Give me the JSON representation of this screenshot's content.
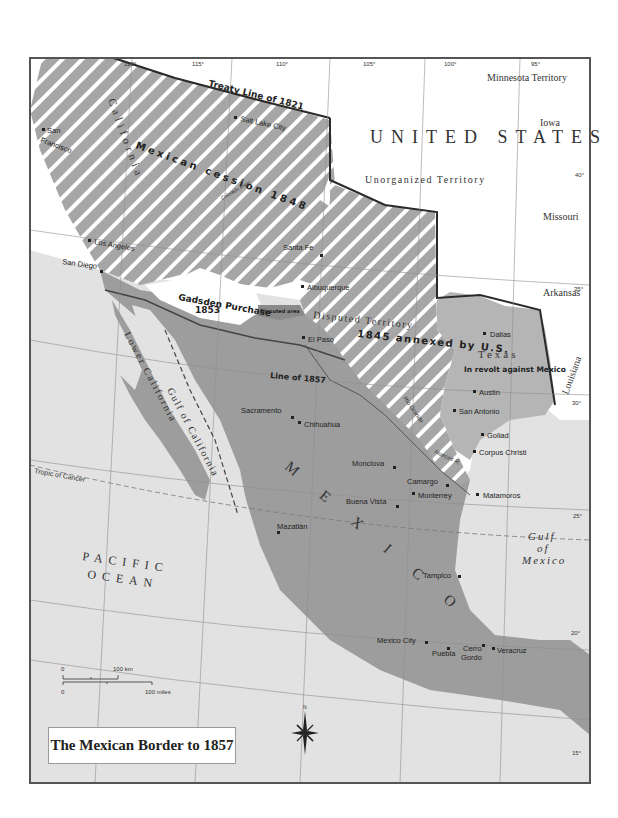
{
  "map": {
    "title": "The Mexican Border to 1857",
    "colors": {
      "mexico": "#9d9d9d",
      "us_land": "#ffffff",
      "water": "#e2e2e2",
      "hatch_base": "#a6a6a6",
      "hatch_stripe": "#ffffff",
      "texas": "#b5b5b5",
      "gadsden": "#ffffff",
      "border_dark": "#2a2a2a",
      "frame": "#555555"
    },
    "regions": {
      "united_states": "UNITED STATES",
      "unorganized": "Unorganized Territory",
      "minnesota": "Minnesota Territory",
      "iowa": "Iowa",
      "missouri": "Missouri",
      "arkansas": "Arkansas",
      "louisiana": "Louisiana",
      "california": "California",
      "mexican_cession": "Mexican cession 1848",
      "gadsden": "Gadsden Purchase",
      "gadsden_year": "1853",
      "disputed_area": "Disputed area",
      "disputed_territory": "Disputed Territory",
      "annexed": "1845 annexed by U.S.",
      "texas": "Texas",
      "texas_revolt": "In revolt against Mexico",
      "mexico": "M E X I C O",
      "lower_california": "Lower California",
      "gulf_california": "Gulf of California",
      "pacific_1": "PACIFIC",
      "pacific_2": "OCEAN",
      "gulf_mexico_1": "Gulf",
      "gulf_mexico_2": "of",
      "gulf_mexico_3": "Mexico"
    },
    "lines": {
      "treaty_1821": "Treaty Line of 1821",
      "line_1857": "Line of 1857",
      "tropic": "Tropic of Cancer",
      "rio_grande": "Rio Grande",
      "nueces": "Nueces R.",
      "colorado": "Colorado River"
    },
    "longitudes": [
      "120°",
      "115°",
      "110°",
      "105°",
      "100°",
      "95°"
    ],
    "latitudes": [
      "40°",
      "35°",
      "30°",
      "25°",
      "20°",
      "15°"
    ],
    "cities": [
      {
        "name": "San Francisco",
        "line1": "San",
        "line2": "Francisco"
      },
      {
        "name": "Salt Lake City"
      },
      {
        "name": "Los Angeles"
      },
      {
        "name": "San Diego"
      },
      {
        "name": "Santa Fe"
      },
      {
        "name": "Albuquerque"
      },
      {
        "name": "El Paso"
      },
      {
        "name": "Dallas"
      },
      {
        "name": "Austin"
      },
      {
        "name": "San Antonio"
      },
      {
        "name": "Goliad"
      },
      {
        "name": "Corpus Christi"
      },
      {
        "name": "Sacramento"
      },
      {
        "name": "Chihuahua"
      },
      {
        "name": "Monclova"
      },
      {
        "name": "Camargo"
      },
      {
        "name": "Monterrey"
      },
      {
        "name": "Buena Vista"
      },
      {
        "name": "Matamoros"
      },
      {
        "name": "Mazatlán"
      },
      {
        "name": "Tampico"
      },
      {
        "name": "Mexico City"
      },
      {
        "name": "Puebla"
      },
      {
        "name": "Cerro Gordo",
        "line1": "Cerro",
        "line2": "Gordo"
      },
      {
        "name": "Veracruz"
      }
    ],
    "scale": {
      "km_zero": "0",
      "km_label": "100 km",
      "mi_zero": "0",
      "mi_label": "100 miles"
    },
    "compass": {
      "north": "N"
    }
  }
}
